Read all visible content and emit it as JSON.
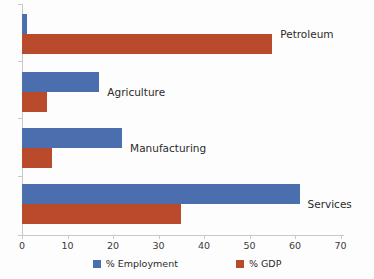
{
  "chart_data": {
    "type": "bar",
    "orientation": "horizontal",
    "title": "",
    "xlabel": "",
    "ylabel": "",
    "xlim": [
      0,
      70
    ],
    "xticks": [
      0,
      10,
      20,
      30,
      40,
      50,
      60,
      70
    ],
    "grid": false,
    "legend_position": "bottom",
    "categories": [
      "Petroleum",
      "Agriculture",
      "Manufacturing",
      "Services"
    ],
    "series": [
      {
        "name": "% Employment",
        "color": "#4A6EAE",
        "values": [
          1,
          17,
          22,
          61
        ]
      },
      {
        "name": "% GDP",
        "color": "#B94A2C",
        "values": [
          55,
          5.5,
          6.5,
          35
        ]
      }
    ]
  },
  "axis": {
    "tick_labels": [
      "0",
      "10",
      "20",
      "30",
      "40",
      "50",
      "60",
      "70"
    ]
  },
  "category_labels": [
    "Petroleum",
    "Agriculture",
    "Manufacturing",
    "Services"
  ],
  "legend": {
    "items": [
      {
        "label": "% Employment",
        "color": "#4A6EAE"
      },
      {
        "label": "% GDP",
        "color": "#B94A2C"
      }
    ]
  },
  "colors": {
    "employment": "#4A6EAE",
    "gdp": "#B94A2C",
    "axis": "#c9c9c9",
    "background": "#fdfdfd"
  }
}
